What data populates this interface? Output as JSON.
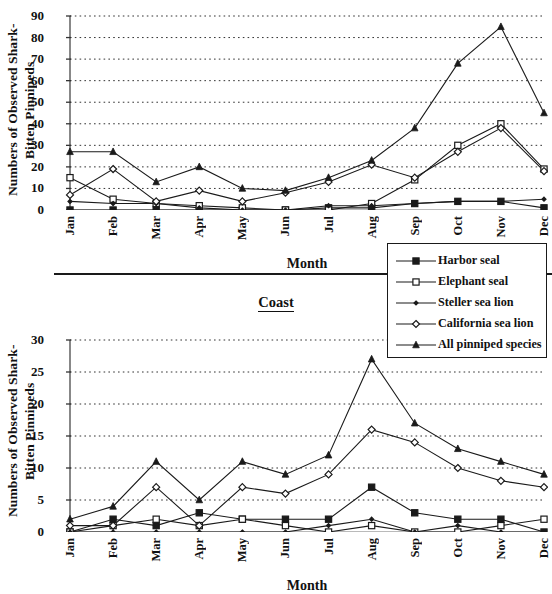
{
  "figure": {
    "separator_label": "Coast",
    "y_axis_title": "Numbers of Observed Shark-\nBitten Pinnipeds",
    "x_axis_title": "Month"
  },
  "legend": {
    "position": "center-right",
    "entries": [
      {
        "label": "Harbor seal",
        "marker": "filled-square"
      },
      {
        "label": "Elephant seal",
        "marker": "open-square"
      },
      {
        "label": "Steller sea lion",
        "marker": "filled-diamond"
      },
      {
        "label": "California sea lion",
        "marker": "open-diamond"
      },
      {
        "label": "All pinniped species",
        "marker": "filled-triangle"
      }
    ]
  },
  "chart_data": [
    {
      "type": "line",
      "title": "",
      "panel": "top",
      "xlabel": "Month",
      "ylabel": "Numbers of Observed Shark-Bitten Pinnipeds",
      "categories": [
        "Jan",
        "Feb",
        "Mar",
        "Apr",
        "May",
        "Jun",
        "Jul",
        "Aug",
        "Sep",
        "Oct",
        "Nov",
        "Dec"
      ],
      "ylim": [
        0,
        90
      ],
      "yticks": [
        0,
        10,
        20,
        30,
        40,
        50,
        60,
        70,
        80,
        90
      ],
      "grid": "horizontal-dotted",
      "series": [
        {
          "name": "Harbor seal",
          "marker": "filled-square",
          "values": [
            0,
            0,
            0,
            0,
            0,
            0,
            1,
            1,
            3,
            4,
            4,
            1
          ]
        },
        {
          "name": "Elephant seal",
          "marker": "open-square",
          "values": [
            15,
            5,
            3,
            2,
            1,
            0,
            0,
            3,
            14,
            30,
            40,
            19
          ]
        },
        {
          "name": "Steller sea lion",
          "marker": "filled-diamond",
          "values": [
            4,
            3,
            3,
            1,
            0,
            0,
            2,
            2,
            3,
            4,
            4,
            5
          ]
        },
        {
          "name": "California sea lion",
          "marker": "open-diamond",
          "values": [
            7,
            19,
            4,
            9,
            4,
            8,
            13,
            21,
            15,
            27,
            38,
            18
          ]
        },
        {
          "name": "All pinniped species",
          "marker": "filled-triangle",
          "values": [
            27,
            27,
            13,
            20,
            10,
            9,
            15,
            23,
            38,
            68,
            85,
            45
          ]
        }
      ]
    },
    {
      "type": "line",
      "title": "",
      "panel": "bottom",
      "xlabel": "Month",
      "ylabel": "Numbers of Observed Shark-Bitten Pinnipeds",
      "categories": [
        "Jan",
        "Feb",
        "Mar",
        "Apr",
        "May",
        "Jun",
        "Jul",
        "Aug",
        "Sep",
        "Oct",
        "Nov",
        "Dec"
      ],
      "ylim": [
        0,
        30
      ],
      "yticks": [
        0,
        5,
        10,
        15,
        20,
        25,
        30
      ],
      "grid": "horizontal-dotted",
      "series": [
        {
          "name": "Harbor seal",
          "marker": "filled-square",
          "values": [
            0,
            2,
            1,
            3,
            2,
            2,
            2,
            7,
            3,
            2,
            2,
            0
          ]
        },
        {
          "name": "Elephant seal",
          "marker": "open-square",
          "values": [
            0,
            1,
            2,
            1,
            2,
            1,
            0,
            1,
            0,
            0,
            1,
            2
          ]
        },
        {
          "name": "Steller sea lion",
          "marker": "filled-diamond",
          "values": [
            0,
            0,
            0,
            0,
            0,
            0,
            1,
            2,
            0,
            1,
            0,
            0
          ]
        },
        {
          "name": "California sea lion",
          "marker": "open-diamond",
          "values": [
            1,
            1,
            7,
            1,
            7,
            6,
            9,
            16,
            14,
            10,
            8,
            7
          ]
        },
        {
          "name": "All pinniped species",
          "marker": "filled-triangle",
          "values": [
            2,
            4,
            11,
            5,
            11,
            9,
            12,
            27,
            17,
            13,
            11,
            9
          ]
        }
      ]
    }
  ]
}
